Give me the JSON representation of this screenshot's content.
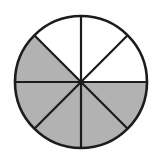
{
  "figure": {
    "shape": "circle",
    "total_sectors": 8,
    "shaded_sectors": 5,
    "unshaded_sectors": 3,
    "fraction_shaded": "5/8",
    "sector_angle_degrees": 45,
    "center_x": 81,
    "center_y": 82,
    "radius": 66,
    "background_color": "#fefefe",
    "shaded_color": "#b2b2b2",
    "unshaded_color": "#ffffff",
    "outline_color": "#1c1c1c",
    "outline_width": 2.6,
    "radius_line_width": 2.2,
    "sectors": [
      {
        "index": 0,
        "start_deg": 0,
        "end_deg": 45,
        "shaded": false,
        "label": "sector-e-ne"
      },
      {
        "index": 1,
        "start_deg": 45,
        "end_deg": 90,
        "shaded": false,
        "label": "sector-ne-n"
      },
      {
        "index": 2,
        "start_deg": 90,
        "end_deg": 135,
        "shaded": false,
        "label": "sector-n-nw"
      },
      {
        "index": 3,
        "start_deg": 135,
        "end_deg": 180,
        "shaded": true,
        "label": "sector-nw-w"
      },
      {
        "index": 4,
        "start_deg": 180,
        "end_deg": 225,
        "shaded": true,
        "label": "sector-w-sw"
      },
      {
        "index": 5,
        "start_deg": 225,
        "end_deg": 270,
        "shaded": true,
        "label": "sector-sw-s"
      },
      {
        "index": 6,
        "start_deg": 270,
        "end_deg": 315,
        "shaded": true,
        "label": "sector-s-se"
      },
      {
        "index": 7,
        "start_deg": 315,
        "end_deg": 360,
        "shaded": true,
        "label": "sector-se-e"
      }
    ],
    "radii_angles_degrees": [
      0,
      45,
      90,
      135,
      180,
      225,
      270,
      315
    ]
  }
}
